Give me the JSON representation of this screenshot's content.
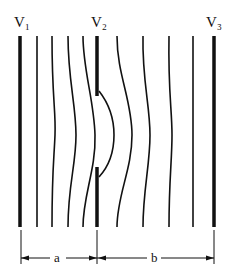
{
  "diagram": {
    "labels": {
      "v1": "V₁",
      "v2": "V₂",
      "v3": "V₃",
      "a": "a",
      "b": "b"
    },
    "colors": {
      "line": "#111111",
      "background": "#ffffff"
    }
  }
}
